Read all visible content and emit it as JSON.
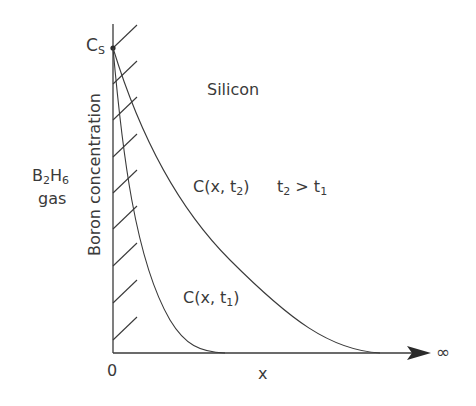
{
  "diagram": {
    "surface_concentration": {
      "main": "C",
      "sub": "S"
    },
    "region_gas": {
      "line1_main": "B",
      "line1_sub1": "2",
      "line1_main2": "H",
      "line1_sub2": "6",
      "line2": "gas"
    },
    "region_solid": "Silicon",
    "y_axis_label": "Boron concentration",
    "x_axis_label": "x",
    "x_origin_label": "0",
    "x_end_label": "∞",
    "curves": [
      {
        "name": "C(x, t1)",
        "main": "C(x, t",
        "sub": "1",
        "close": ")"
      },
      {
        "name": "C(x, t2)",
        "main": "C(x, t",
        "sub": "2",
        "close": ")"
      }
    ],
    "condition": {
      "a": "t",
      "a_sub": "2",
      "op": " > ",
      "b": "t",
      "b_sub": "1"
    },
    "colors": {
      "line": "#3a3a3a",
      "background": "#ffffff"
    }
  }
}
